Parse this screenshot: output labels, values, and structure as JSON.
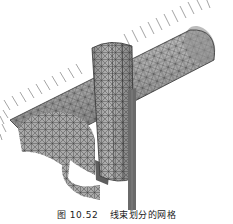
{
  "figure": {
    "colors": {
      "mesh_fill_light": "#b8b8b8",
      "mesh_fill_mid": "#9a9a9a",
      "mesh_fill_dark": "#6e6e6e",
      "mesh_line": "#3a3a3a",
      "arrow": "#555555"
    }
  },
  "caption": {
    "label": "图 10.52",
    "text": "线束划分的网格"
  }
}
